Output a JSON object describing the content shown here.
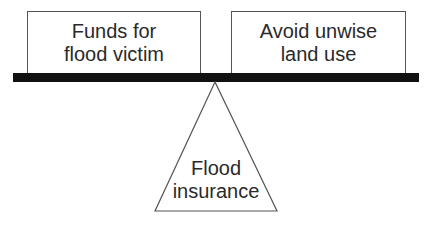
{
  "diagram": {
    "type": "balance-scale",
    "left_weight": {
      "lines": [
        "Funds for",
        "flood victim"
      ]
    },
    "right_weight": {
      "lines": [
        "Avoid unwise",
        "land use"
      ]
    },
    "fulcrum": {
      "lines": [
        "Flood",
        "insurance"
      ]
    },
    "colors": {
      "beam": "#111111",
      "outline": "#555555",
      "text": "#2a2a2a",
      "background": "#ffffff"
    }
  }
}
